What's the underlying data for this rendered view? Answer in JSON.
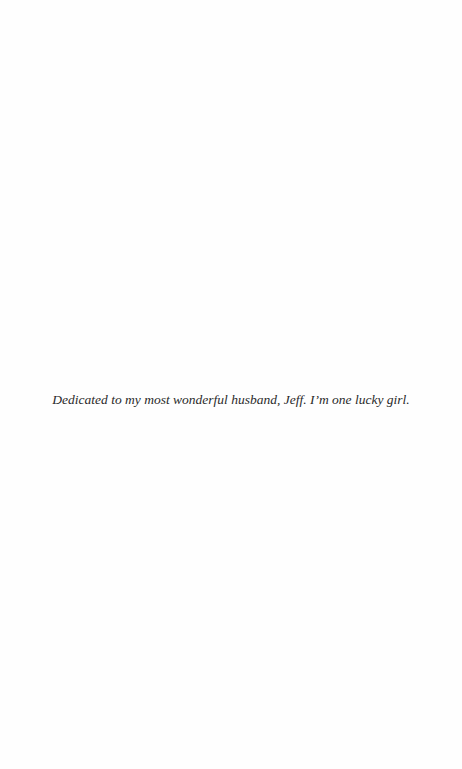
{
  "page": {
    "background": "#fefefe",
    "dedication": "Dedicated to my most wonderful husband, Jeff. I’m one lucky girl."
  }
}
